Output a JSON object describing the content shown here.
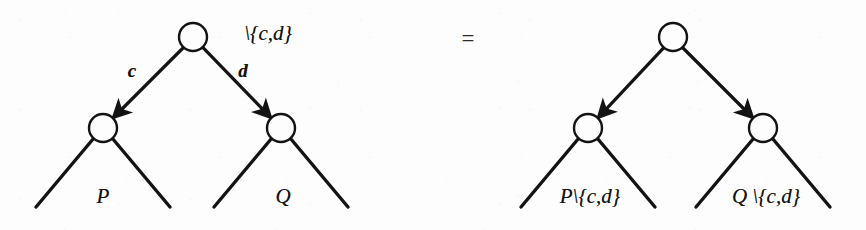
{
  "figure": {
    "kind": "tree-rewriting-equation",
    "background_color": "#fdfdfd",
    "ink_color": "#131313",
    "width": 866,
    "height": 230
  },
  "relation": {
    "symbol": "=",
    "name": "equals-sign",
    "x": 468,
    "y": 38
  },
  "left_side": {
    "name": "restriction-applied-at-root",
    "root_annotation": "\\{c,d}",
    "root_annotation_x": 268,
    "root_annotation_y": 33,
    "nodes": [
      {
        "id": "root",
        "label": "",
        "cx": 193,
        "cy": 37,
        "r": 14
      },
      {
        "id": "left-child",
        "label": "",
        "cx": 103,
        "cy": 128,
        "r": 14
      },
      {
        "id": "right-child",
        "label": "",
        "cx": 281,
        "cy": 128,
        "r": 14
      }
    ],
    "arrows": [
      {
        "id": "edge-c",
        "label": "c",
        "from": "root",
        "to": "left-child",
        "label_x": 132,
        "label_y": 70
      },
      {
        "id": "edge-d",
        "label": "d",
        "from": "root",
        "to": "right-child",
        "label_x": 243,
        "label_y": 70
      }
    ],
    "subtrees": [
      {
        "id": "subtree-P",
        "label": "P",
        "apex_x": 103,
        "apex_y": 142,
        "left_x": 36,
        "right_x": 170,
        "base_y": 207,
        "label_x": 103,
        "label_y": 196
      },
      {
        "id": "subtree-Q",
        "label": "Q",
        "apex_x": 281,
        "apex_y": 142,
        "left_x": 214,
        "right_x": 348,
        "base_y": 207,
        "label_x": 283,
        "label_y": 196
      }
    ]
  },
  "right_side": {
    "name": "restriction-pushed-into-subtrees",
    "root_annotation": "",
    "nodes": [
      {
        "id": "root",
        "label": "",
        "cx": 673,
        "cy": 37,
        "r": 14
      },
      {
        "id": "left-child",
        "label": "",
        "cx": 588,
        "cy": 128,
        "r": 14
      },
      {
        "id": "right-child",
        "label": "",
        "cx": 763,
        "cy": 128,
        "r": 14
      }
    ],
    "arrows": [
      {
        "id": "edge-left",
        "label": "",
        "from": "root",
        "to": "left-child"
      },
      {
        "id": "edge-right",
        "label": "",
        "from": "root",
        "to": "right-child"
      }
    ],
    "subtrees": [
      {
        "id": "subtree-P-restricted",
        "label": "P\\{c,d}",
        "apex_x": 588,
        "apex_y": 142,
        "left_x": 521,
        "right_x": 655,
        "base_y": 207,
        "label_x": 590,
        "label_y": 196
      },
      {
        "id": "subtree-Q-restricted",
        "label": "Q \\{c,d}",
        "apex_x": 763,
        "apex_y": 142,
        "left_x": 696,
        "right_x": 830,
        "base_y": 207,
        "label_x": 766,
        "label_y": 196
      }
    ]
  }
}
